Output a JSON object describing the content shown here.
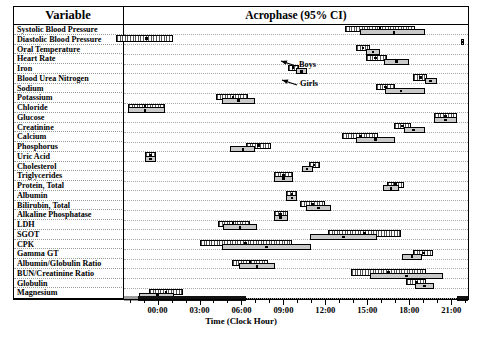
{
  "header": {
    "variable_col": "Variable",
    "acrophase_col": "Acrophase (95% CI)"
  },
  "axis": {
    "title": "Time (Clock Hour)",
    "ticks": [
      "00:00",
      "03:00",
      "06:00",
      "09:00",
      "12:00",
      "15:00",
      "18:00",
      "21:00"
    ],
    "tick_hours": [
      0,
      3,
      6,
      9,
      12,
      15,
      18,
      21
    ],
    "xmin_hour": -2.4,
    "xmax_hour": 22.2
  },
  "annotations": [
    {
      "label": "Boys",
      "series": "boys"
    },
    {
      "label": "Girls",
      "series": "girls"
    }
  ],
  "legend": {
    "boys_style": "hatched",
    "girls_style": "grey",
    "marker": "acrophase-point"
  },
  "colors": {
    "boys_fill": "#ffffff",
    "girls_fill": "#c9c9c9",
    "border": "#000000",
    "grid": "#a8a8a8",
    "night_band": "#111111",
    "twilight_band": "#9d9d9d"
  },
  "night_band": {
    "start_hour": -1.4,
    "end_hour": 6.3,
    "second_start_hour": 21.4,
    "second_end_hour": 22.2
  },
  "chart_data": {
    "type": "bar",
    "title": "Acrophase (95% CI)",
    "xlabel": "Time (Clock Hour)",
    "ylabel": "Variable",
    "xlim": [
      -2.4,
      22.2
    ],
    "grid": true,
    "orientation": "horizontal-interval",
    "series": [
      {
        "name": "Boys",
        "style": "hatched"
      },
      {
        "name": "Girls",
        "style": "grey"
      }
    ],
    "categories": [
      "Systolic Blood Pressure",
      "Diastolic Blood Pressure",
      "Oral Temperature",
      "Heart Rate",
      "Iron",
      "Blood Urea Nitrogen",
      "Sodium",
      "Potassium",
      "Chloride",
      "Glucose",
      "Creatinine",
      "Calcium",
      "Phosphorus",
      "Uric Acid",
      "Cholesterol",
      "Triglycerides",
      "Protein, Total",
      "Albumin",
      "Bilirubin, Total",
      "Alkaline Phosphatase",
      "LDH",
      "SGOT",
      "CPK",
      "Gamma GT",
      "Albumin/Globulin Ratio",
      "BUN/Creatinine Ratio",
      "Globulin",
      "Magnesium"
    ],
    "rows": [
      {
        "variable": "Systolic Blood Pressure",
        "boys": {
          "low": 13.4,
          "acrophase": 15.9,
          "high": 18.4
        },
        "girls": {
          "low": 14.5,
          "acrophase": 16.9,
          "high": 19.1
        }
      },
      {
        "variable": "Diastolic Blood Pressure",
        "boys": {
          "low": -3.0,
          "acrophase": -0.8,
          "high": 1.1
        },
        "girls": {
          "low": 21.7,
          "acrophase": 21.8,
          "high": 21.9
        }
      },
      {
        "variable": "Oral Temperature",
        "boys": {
          "low": 14.2,
          "acrophase": 14.7,
          "high": 15.2
        },
        "girls": {
          "low": 14.9,
          "acrophase": 15.4,
          "high": 15.9
        }
      },
      {
        "variable": "Heart Rate",
        "boys": {
          "low": 14.9,
          "acrophase": 15.6,
          "high": 16.4
        },
        "girls": {
          "low": 16.2,
          "acrophase": 17.1,
          "high": 18.0
        }
      },
      {
        "variable": "Iron",
        "boys": {
          "low": 9.3,
          "acrophase": 9.7,
          "high": 10.1
        },
        "girls": {
          "low": 9.9,
          "acrophase": 10.3,
          "high": 10.7
        }
      },
      {
        "variable": "Blood Urea Nitrogen",
        "boys": {
          "low": 18.3,
          "acrophase": 18.8,
          "high": 19.3
        },
        "girls": {
          "low": 19.1,
          "acrophase": 19.5,
          "high": 20.0
        }
      },
      {
        "variable": "Sodium",
        "boys": {
          "low": 15.6,
          "acrophase": 16.3,
          "high": 17.0
        },
        "girls": {
          "low": 16.3,
          "acrophase": 17.4,
          "high": 19.1
        }
      },
      {
        "variable": "Potassium",
        "boys": {
          "low": 4.2,
          "acrophase": 5.4,
          "high": 6.5
        },
        "girls": {
          "low": 4.6,
          "acrophase": 5.8,
          "high": 7.0
        }
      },
      {
        "variable": "Chloride",
        "boys": {
          "low": -2.1,
          "acrophase": -0.9,
          "high": 0.5
        },
        "girls": {
          "low": -2.1,
          "acrophase": -0.9,
          "high": 0.5
        }
      },
      {
        "variable": "Glucose",
        "boys": {
          "low": 19.8,
          "acrophase": 20.6,
          "high": 21.4
        },
        "girls": {
          "low": 19.8,
          "acrophase": 20.6,
          "high": 21.4
        }
      },
      {
        "variable": "Creatinine",
        "boys": {
          "low": 16.9,
          "acrophase": 17.5,
          "high": 18.1
        },
        "girls": {
          "low": 17.6,
          "acrophase": 18.3,
          "high": 19.1
        }
      },
      {
        "variable": "Calcium",
        "boys": {
          "low": 13.2,
          "acrophase": 14.5,
          "high": 15.8
        },
        "girls": {
          "low": 14.2,
          "acrophase": 15.6,
          "high": 17.0
        }
      },
      {
        "variable": "Phosphorus",
        "boys": {
          "low": 6.3,
          "acrophase": 7.2,
          "high": 8.1
        },
        "girls": {
          "low": 5.2,
          "acrophase": 6.1,
          "high": 7.0
        }
      },
      {
        "variable": "Uric Acid",
        "boys": {
          "low": -0.9,
          "acrophase": -0.5,
          "high": -0.1
        },
        "girls": {
          "low": -0.9,
          "acrophase": -0.5,
          "high": -0.1
        }
      },
      {
        "variable": "Cholesterol",
        "boys": {
          "low": 10.8,
          "acrophase": 11.2,
          "high": 11.6
        },
        "girls": {
          "low": 10.3,
          "acrophase": 10.7,
          "high": 11.1
        }
      },
      {
        "variable": "Triglycerides",
        "boys": {
          "low": 8.3,
          "acrophase": 9.0,
          "high": 9.7
        },
        "girls": {
          "low": 8.3,
          "acrophase": 9.0,
          "high": 9.7
        }
      },
      {
        "variable": "Protein, Total",
        "boys": {
          "low": 16.4,
          "acrophase": 17.0,
          "high": 17.6
        },
        "girls": {
          "low": 16.1,
          "acrophase": 16.7,
          "high": 17.3
        }
      },
      {
        "variable": "Albumin",
        "boys": {
          "low": 9.2,
          "acrophase": 9.6,
          "high": 10.0
        },
        "girls": {
          "low": 9.2,
          "acrophase": 9.6,
          "high": 10.0
        }
      },
      {
        "variable": "Bilirubin, Total",
        "boys": {
          "low": 10.2,
          "acrophase": 11.1,
          "high": 12.0
        },
        "girls": {
          "low": 10.6,
          "acrophase": 11.5,
          "high": 12.4
        }
      },
      {
        "variable": "Alkaline Phosphatase",
        "boys": {
          "low": 8.3,
          "acrophase": 8.8,
          "high": 9.3
        },
        "girls": {
          "low": 8.3,
          "acrophase": 8.8,
          "high": 9.3
        }
      },
      {
        "variable": "LDH",
        "boys": {
          "low": 4.3,
          "acrophase": 5.4,
          "high": 6.6
        },
        "girls": {
          "low": 4.7,
          "acrophase": 5.9,
          "high": 7.1
        }
      },
      {
        "variable": "SGOT",
        "boys": {
          "low": 12.2,
          "acrophase": 14.8,
          "high": 17.4
        },
        "girls": {
          "low": 10.9,
          "acrophase": 13.3,
          "high": 15.7
        }
      },
      {
        "variable": "CPK",
        "boys": {
          "low": 3.0,
          "acrophase": 6.3,
          "high": 9.6
        },
        "girls": {
          "low": 4.6,
          "acrophase": 7.8,
          "high": 11.0
        }
      },
      {
        "variable": "Gamma GT",
        "boys": {
          "low": 18.3,
          "acrophase": 19.0,
          "high": 19.7
        },
        "girls": {
          "low": 17.5,
          "acrophase": 18.2,
          "high": 18.9
        }
      },
      {
        "variable": "Albumin/Globulin Ratio",
        "boys": {
          "low": 5.3,
          "acrophase": 6.6,
          "high": 7.9
        },
        "girls": {
          "low": 5.8,
          "acrophase": 7.1,
          "high": 8.4
        }
      },
      {
        "variable": "BUN/Creatinine Ratio",
        "boys": {
          "low": 13.8,
          "acrophase": 16.5,
          "high": 19.2
        },
        "girls": {
          "low": 15.2,
          "acrophase": 17.8,
          "high": 20.4
        }
      },
      {
        "variable": "Globulin",
        "boys": {
          "low": 17.8,
          "acrophase": 18.5,
          "high": 19.2
        },
        "girls": {
          "low": 18.4,
          "acrophase": 19.1,
          "high": 19.8
        }
      },
      {
        "variable": "Magnesium",
        "boys": {
          "low": -0.6,
          "acrophase": 0.6,
          "high": 1.8
        },
        "girls": {
          "low": -1.3,
          "acrophase": 0.0,
          "high": 1.2
        }
      }
    ]
  }
}
